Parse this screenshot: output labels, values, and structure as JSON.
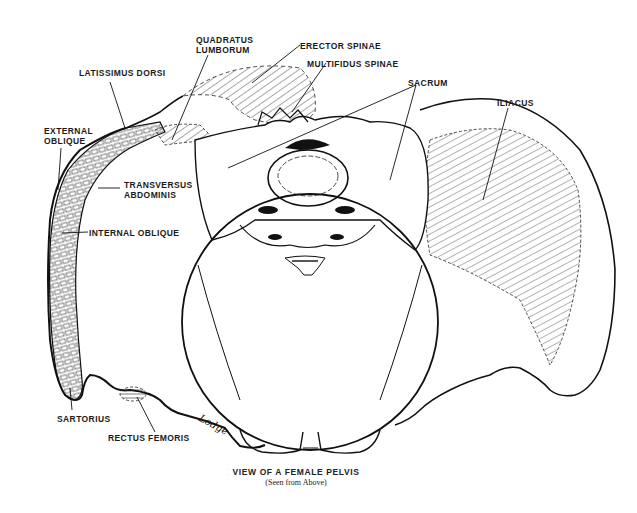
{
  "figure": {
    "title": "VIEW OF A FEMALE PELVIS",
    "subtitle": "(Seen from Above)",
    "signature": "Lodge",
    "colors": {
      "line": "#111111",
      "background": "#ffffff",
      "hatch": "#222222"
    }
  },
  "labels": {
    "quadratus_lumborum_1": "QUADRATUS",
    "quadratus_lumborum_2": "LUMBORUM",
    "erector_spinae": "ERECTOR SPINAE",
    "multifidus_spinae": "MULTIFIDUS SPINAE",
    "latissimus_dorsi": "LATISSIMUS DORSI",
    "sacrum": "SACRUM",
    "iliacus": "ILIACUS",
    "external_oblique_1": "EXTERNAL",
    "external_oblique_2": "OBLIQUE",
    "transversus_abdominis_1": "TRANSVERSUS",
    "transversus_abdominis_2": "ABDOMINIS",
    "internal_oblique": "INTERNAL OBLIQUE",
    "sartorius": "SARTORIUS",
    "rectus_femoris": "RECTUS FEMORIS"
  }
}
